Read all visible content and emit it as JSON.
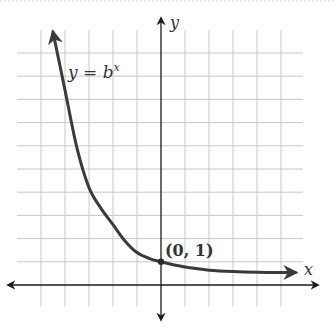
{
  "figure": {
    "function_label": "y = b",
    "function_exponent": "x",
    "point_label": "(0, 1)",
    "x_axis_label": "x",
    "y_axis_label": "y"
  },
  "colors": {
    "background": "#ffffff",
    "grid": "#c8c8c8",
    "axis": "#1a1a1a",
    "curve": "#3a3a3a",
    "text": "#222222"
  },
  "chart_data": {
    "type": "line",
    "xlabel": "x",
    "ylabel": "y",
    "grid": true,
    "tick_labels_shown": false,
    "xlim": [
      -6,
      6
    ],
    "ylim": [
      -1,
      11
    ],
    "annotations": [
      {
        "text": "(0, 1)",
        "x": 0,
        "y": 1
      },
      {
        "text": "y = b^x",
        "x": -3.8,
        "y": 9
      }
    ],
    "series": [
      {
        "name": "y = b^x",
        "x": [
          -4.5,
          -4,
          -3.5,
          -3,
          -2.5,
          -2,
          -1.5,
          -1,
          -0.5,
          0,
          1,
          2,
          3,
          4,
          5,
          5.6
        ],
        "y": [
          10.9,
          8.4,
          5.9,
          4.2,
          3.3,
          2.6,
          1.9,
          1.4,
          1.15,
          1.0,
          0.77,
          0.64,
          0.58,
          0.55,
          0.54,
          0.54
        ]
      }
    ],
    "highlight_points": [
      {
        "x": 0,
        "y": 1
      }
    ]
  },
  "layout": {
    "origin_px": [
      161,
      285
    ],
    "unit_px": [
      24,
      23.2
    ],
    "grid_left": 17,
    "grid_right": 303,
    "grid_top": 30,
    "grid_bottom": 307
  }
}
